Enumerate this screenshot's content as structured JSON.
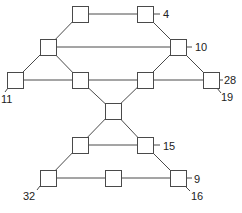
{
  "diagram": {
    "type": "network-graph",
    "node_size": 16,
    "colors": {
      "stroke": "#4a4a4a",
      "fill": "#ffffff",
      "label": "#222222"
    },
    "nodes": [
      {
        "id": "A",
        "x": 72,
        "y": 6
      },
      {
        "id": "B",
        "x": 137,
        "y": 6
      },
      {
        "id": "C",
        "x": 40,
        "y": 39
      },
      {
        "id": "D",
        "x": 170,
        "y": 39
      },
      {
        "id": "E",
        "x": 7,
        "y": 72
      },
      {
        "id": "F",
        "x": 72,
        "y": 72
      },
      {
        "id": "G",
        "x": 137,
        "y": 72
      },
      {
        "id": "H",
        "x": 203,
        "y": 72
      },
      {
        "id": "I",
        "x": 105,
        "y": 103
      },
      {
        "id": "J",
        "x": 72,
        "y": 137
      },
      {
        "id": "K",
        "x": 137,
        "y": 137
      },
      {
        "id": "L",
        "x": 40,
        "y": 170
      },
      {
        "id": "M",
        "x": 105,
        "y": 170
      },
      {
        "id": "N",
        "x": 170,
        "y": 170
      }
    ],
    "edges": [
      [
        "A",
        "B"
      ],
      [
        "A",
        "C"
      ],
      [
        "B",
        "D"
      ],
      [
        "C",
        "D"
      ],
      [
        "C",
        "E"
      ],
      [
        "C",
        "F"
      ],
      [
        "D",
        "G"
      ],
      [
        "D",
        "H"
      ],
      [
        "E",
        "F"
      ],
      [
        "F",
        "G"
      ],
      [
        "G",
        "H"
      ],
      [
        "F",
        "I"
      ],
      [
        "G",
        "I"
      ],
      [
        "I",
        "J"
      ],
      [
        "I",
        "K"
      ],
      [
        "J",
        "K"
      ],
      [
        "J",
        "L"
      ],
      [
        "K",
        "N"
      ],
      [
        "L",
        "M"
      ],
      [
        "M",
        "N"
      ]
    ],
    "labels": [
      {
        "text": "4",
        "node": "B",
        "x": 163,
        "y": 18,
        "tick": [
          153,
          14,
          160,
          14
        ]
      },
      {
        "text": "10",
        "node": "D",
        "x": 195,
        "y": 51,
        "tick": [
          186,
          47,
          192,
          47
        ]
      },
      {
        "text": "28",
        "node": "H",
        "x": 224,
        "y": 84,
        "tick": [
          219,
          80,
          223,
          80
        ]
      },
      {
        "text": "19",
        "node": "H",
        "x": 221,
        "y": 101,
        "tick": [
          217,
          88,
          221,
          93
        ]
      },
      {
        "text": "11",
        "node": "E",
        "x": 1,
        "y": 103,
        "tick": [
          8,
          88,
          5,
          92
        ]
      },
      {
        "text": "15",
        "node": "K",
        "x": 163,
        "y": 150,
        "tick": [
          153,
          145,
          160,
          145
        ]
      },
      {
        "text": "9",
        "node": "N",
        "x": 194,
        "y": 183,
        "tick": [
          186,
          178,
          192,
          178
        ]
      },
      {
        "text": "16",
        "node": "N",
        "x": 191,
        "y": 200,
        "tick": [
          185,
          186,
          190,
          191
        ]
      },
      {
        "text": "32",
        "node": "L",
        "x": 23,
        "y": 200,
        "tick": [
          40,
          186,
          37,
          190
        ]
      }
    ]
  }
}
